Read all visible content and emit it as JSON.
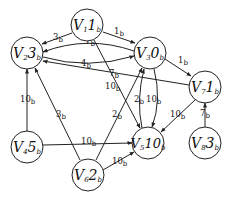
{
  "diagram": {
    "type": "weighted-directed-graph",
    "nodes": [
      {
        "id": "V1",
        "name": "V",
        "index": "1",
        "value": "1",
        "unit": "b",
        "x": 87,
        "y": 25
      },
      {
        "id": "V2",
        "name": "V",
        "index": "2",
        "value": "3",
        "unit": "b",
        "x": 27,
        "y": 53
      },
      {
        "id": "V3",
        "name": "V",
        "index": "3",
        "value": "0",
        "unit": "b",
        "x": 150,
        "y": 53
      },
      {
        "id": "V7",
        "name": "V",
        "index": "7",
        "value": "1",
        "unit": "b",
        "x": 205,
        "y": 87
      },
      {
        "id": "V4",
        "name": "V",
        "index": "4",
        "value": "5",
        "unit": "b",
        "x": 27,
        "y": 147
      },
      {
        "id": "V5",
        "name": "V",
        "index": "5",
        "value": "10",
        "unit": "b",
        "x": 148,
        "y": 143
      },
      {
        "id": "V6",
        "name": "V",
        "index": "6",
        "value": "2",
        "unit": "b",
        "x": 88,
        "y": 175
      },
      {
        "id": "V8",
        "name": "V",
        "index": "8",
        "value": "3",
        "unit": "b",
        "x": 205,
        "y": 143
      }
    ],
    "edges": [
      {
        "from": "V1",
        "to": "V2",
        "weight": "3",
        "unit": "b"
      },
      {
        "from": "V1",
        "to": "V3",
        "weight": "1",
        "unit": "b"
      },
      {
        "from": "V3",
        "to": "V2",
        "weight": "1",
        "unit": "b"
      },
      {
        "from": "V2",
        "to": "V3",
        "weight": "4",
        "unit": "b"
      },
      {
        "from": "V7",
        "to": "V2",
        "weight": "7",
        "unit": "b"
      },
      {
        "from": "V1",
        "to": "V5",
        "weight": "10",
        "unit": "b"
      },
      {
        "from": "V3",
        "to": "V7",
        "weight": "1",
        "unit": "b"
      },
      {
        "from": "V5",
        "to": "V3",
        "weight": "2",
        "unit": "b"
      },
      {
        "from": "V3",
        "to": "V5",
        "weight": "10",
        "unit": "b"
      },
      {
        "from": "V7",
        "to": "V5",
        "weight": "10",
        "unit": "b"
      },
      {
        "from": "V8",
        "to": "V7",
        "weight": "7",
        "unit": "b"
      },
      {
        "from": "V4",
        "to": "V2",
        "weight": "10",
        "unit": "b"
      },
      {
        "from": "V6",
        "to": "V2",
        "weight": "3",
        "unit": "b"
      },
      {
        "from": "V4",
        "to": "V5",
        "weight": "10",
        "unit": "b"
      },
      {
        "from": "V6",
        "to": "V3",
        "weight": "2",
        "unit": "b"
      },
      {
        "from": "V6",
        "to": "V5",
        "weight": "10",
        "unit": "b"
      }
    ]
  },
  "labels": {
    "V1": {
      "name": "V",
      "index": "1",
      "value": "1",
      "unit": "b"
    },
    "V2": {
      "name": "V",
      "index": "2",
      "value": "3",
      "unit": "b"
    },
    "V3": {
      "name": "V",
      "index": "3",
      "value": "0",
      "unit": "b"
    },
    "V4": {
      "name": "V",
      "index": "4",
      "value": "5",
      "unit": "b"
    },
    "V5": {
      "name": "V",
      "index": "5",
      "value": "10",
      "unit": "b"
    },
    "V6": {
      "name": "V",
      "index": "6",
      "value": "2",
      "unit": "b"
    },
    "V7": {
      "name": "V",
      "index": "7",
      "value": "1",
      "unit": "b"
    },
    "V8": {
      "name": "V",
      "index": "8",
      "value": "3",
      "unit": "b"
    },
    "e_v1_v2": {
      "w": "3",
      "u": "b"
    },
    "e_v1_v3": {
      "w": "1",
      "u": "b"
    },
    "e_v3_v2": {
      "w": "1",
      "u": "b"
    },
    "e_v2_v3": {
      "w": "4",
      "u": "b"
    },
    "e_v7_v2": {
      "w": "7",
      "u": "b"
    },
    "e_v1_v5": {
      "w": "10",
      "u": "b"
    },
    "e_v3_v7": {
      "w": "1",
      "u": "b"
    },
    "e_v5_v3": {
      "w": "2",
      "u": "b"
    },
    "e_v3_v5": {
      "w": "10",
      "u": "b"
    },
    "e_v7_v5": {
      "w": "10",
      "u": "b"
    },
    "e_v8_v7": {
      "w": "7",
      "u": "b"
    },
    "e_v4_v2": {
      "w": "10",
      "u": "b"
    },
    "e_v6_v2": {
      "w": "3",
      "u": "b"
    },
    "e_v4_v5": {
      "w": "10",
      "u": "b"
    },
    "e_v6_v3": {
      "w": "2",
      "u": "b"
    },
    "e_v6_v5": {
      "w": "10",
      "u": "b"
    }
  }
}
